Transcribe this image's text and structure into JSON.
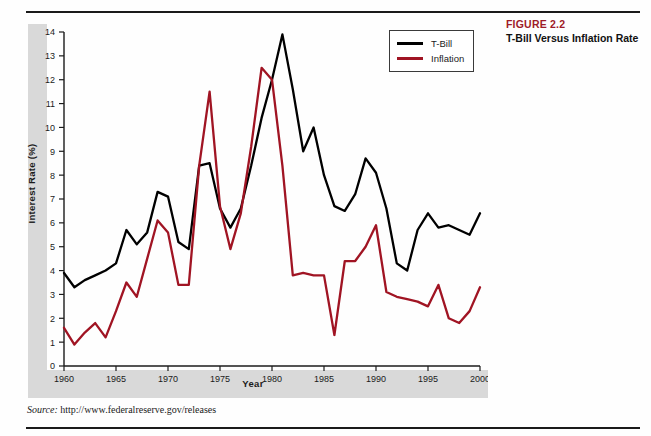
{
  "caption": {
    "figure_number": "FIGURE 2.2",
    "figure_title": "T-Bill Versus Inflation Rate",
    "number_color": "#9e1b28"
  },
  "source": {
    "label": "Source:",
    "url": "http://www.federalreserve.gov/releases"
  },
  "legend": {
    "position": "top-right-inside",
    "items": [
      {
        "label": "T-Bill",
        "color": "#000000"
      },
      {
        "label": "Inflation",
        "color": "#a01423"
      }
    ]
  },
  "chart_data": {
    "type": "line",
    "title": "T-Bill Versus Inflation Rate",
    "xlabel": "Year",
    "ylabel": "Interest Rate (%)",
    "xlim": [
      1960,
      2000
    ],
    "ylim": [
      0,
      14
    ],
    "grid": false,
    "x_ticks": [
      1960,
      1965,
      1970,
      1975,
      1980,
      1985,
      1990,
      1995,
      2000
    ],
    "y_ticks": [
      0,
      1,
      2,
      3,
      4,
      5,
      6,
      7,
      8,
      9,
      10,
      11,
      12,
      13,
      14
    ],
    "x": [
      1960,
      1961,
      1962,
      1963,
      1964,
      1965,
      1966,
      1967,
      1968,
      1969,
      1970,
      1971,
      1972,
      1973,
      1974,
      1975,
      1976,
      1977,
      1978,
      1979,
      1980,
      1981,
      1982,
      1983,
      1984,
      1985,
      1986,
      1987,
      1988,
      1989,
      1990,
      1991,
      1992,
      1993,
      1994,
      1995,
      1996,
      1997,
      1998,
      1999,
      2000
    ],
    "series": [
      {
        "name": "T-Bill",
        "color": "#000000",
        "values": [
          3.9,
          3.3,
          3.6,
          3.8,
          4.0,
          4.3,
          5.7,
          5.1,
          5.6,
          7.3,
          7.1,
          5.2,
          4.9,
          8.4,
          8.5,
          6.6,
          5.8,
          6.6,
          8.4,
          10.4,
          12.0,
          13.9,
          11.6,
          9.0,
          10.0,
          8.0,
          6.7,
          6.5,
          7.2,
          8.7,
          8.1,
          6.6,
          4.3,
          4.0,
          5.7,
          6.4,
          5.8,
          5.9,
          5.7,
          5.5,
          6.4
        ]
      },
      {
        "name": "Inflation",
        "color": "#a01423",
        "values": [
          1.6,
          0.9,
          1.4,
          1.8,
          1.2,
          2.3,
          3.5,
          2.9,
          4.5,
          6.1,
          5.6,
          3.4,
          3.4,
          8.4,
          11.5,
          6.7,
          4.9,
          6.4,
          9.2,
          12.5,
          12.0,
          8.4,
          3.8,
          3.9,
          3.8,
          3.8,
          1.3,
          4.4,
          4.4,
          5.0,
          5.9,
          3.1,
          2.9,
          2.8,
          2.7,
          2.5,
          3.4,
          2.0,
          1.8,
          2.3,
          3.3
        ]
      }
    ]
  }
}
